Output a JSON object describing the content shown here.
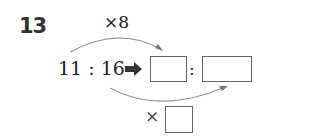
{
  "problem": {
    "number": "13",
    "top_multiplier": "×8",
    "ratio": "11 : 16",
    "arrow": "right-arrow-icon",
    "answer_separator": ":",
    "bottom_multiplier_prefix": "×",
    "blanks": [
      "",
      "",
      ""
    ]
  }
}
